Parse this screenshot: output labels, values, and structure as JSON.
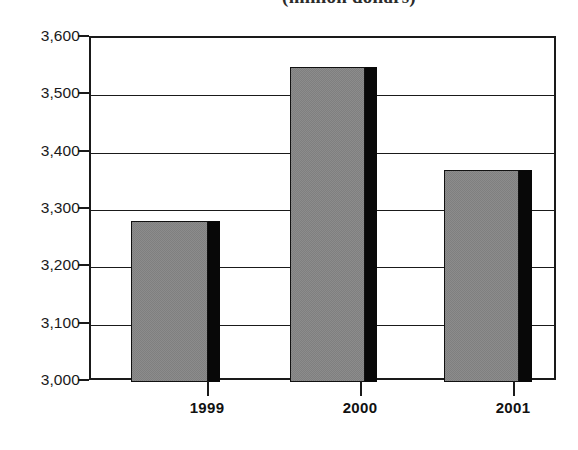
{
  "chart_data": {
    "type": "bar",
    "title": "(million dollars)",
    "title_note": "clipped at top edge of image",
    "xlabel": "",
    "ylabel": "",
    "categories": [
      "1999",
      "2000",
      "2001"
    ],
    "values": [
      3280,
      3550,
      3370
    ],
    "value_labels": [
      "3,280",
      "3,550",
      "3,370"
    ],
    "ylim": [
      3000,
      3600
    ],
    "ytick_step": 100,
    "ytick_labels": [
      "3,600",
      "3,500",
      "3,400",
      "3,300",
      "3,200",
      "3,100",
      "3,000"
    ],
    "ytick_values": [
      3600,
      3500,
      3400,
      3300,
      3200,
      3100,
      3000
    ],
    "grid": true,
    "grid_axis": "y",
    "legend": false,
    "legend_position": "none",
    "series": [
      {
        "name": "",
        "values": [
          3280,
          3550,
          3370
        ]
      }
    ],
    "colors": {
      "bar_fill": "#7f7f7f",
      "bar_shadow": "#080808",
      "bar_outline": "#111111",
      "axis": "#1a1a1a",
      "grid": "#1a1a1a",
      "background": "#ffffff",
      "text": "#1a1a1a"
    }
  }
}
